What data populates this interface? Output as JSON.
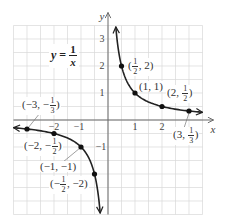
{
  "chart_data": {
    "type": "line",
    "xlabel": "x",
    "ylabel": "y",
    "xlim": [
      -3.5,
      3.5
    ],
    "ylim": [
      -3.5,
      3.5
    ],
    "grid": true,
    "grid_step": 0.5,
    "legend": null,
    "x_ticks": [
      -2,
      -1,
      1,
      2
    ],
    "y_ticks": [
      -1,
      1,
      2,
      3
    ],
    "series": [
      {
        "name": "y = 1/x",
        "function": "1/x",
        "branches": [
          {
            "x_from": 0.29,
            "x_to": 3.5
          },
          {
            "x_from": -3.5,
            "x_to": -0.29
          }
        ],
        "points": [
          {
            "x": 0.5,
            "y": 2
          },
          {
            "x": 1,
            "y": 1
          },
          {
            "x": 2,
            "y": 0.5
          },
          {
            "x": 3,
            "y": 0.3333
          },
          {
            "x": -3,
            "y": -0.3333
          },
          {
            "x": -2,
            "y": -0.5
          },
          {
            "x": -1,
            "y": -1
          },
          {
            "x": -0.5,
            "y": -2
          }
        ]
      }
    ],
    "annotations": [
      "(1/2, 2)",
      "(1, 1)",
      "(2, 1/2)",
      "(3, 1/3)",
      "(−3, −1/3)",
      "(−2, −1/2)",
      "(−1, −1)",
      "(−1/2, −2)"
    ]
  },
  "equation": {
    "lhs": "y",
    "eq": " = ",
    "num": "1",
    "den": "x"
  },
  "axes": {
    "x_label": "x",
    "y_label": "y",
    "x_tick_labels": [
      "−2",
      "−1",
      "1",
      "2"
    ],
    "y_tick_labels": [
      "3",
      "2",
      "1",
      "−1"
    ]
  },
  "point_labels": [
    {
      "pre": "(",
      "num": "1",
      "den": "2",
      "post": ", 2)"
    },
    {
      "pre": "(1, 1)",
      "num": "",
      "den": "",
      "post": ""
    },
    {
      "pre": "(2, ",
      "num": "1",
      "den": "2",
      "post": ")"
    },
    {
      "pre": "(3, ",
      "num": "1",
      "den": "3",
      "post": ")"
    },
    {
      "pre": "(−3, −",
      "num": "1",
      "den": "3",
      "post": ")"
    },
    {
      "pre": "(−2, −",
      "num": "1",
      "den": "2",
      "post": ")"
    },
    {
      "pre": "(−1, −1)",
      "num": "",
      "den": "",
      "post": ""
    },
    {
      "pre": "(−",
      "num": "1",
      "den": "2",
      "post": ", −2)"
    }
  ],
  "colors": {
    "grid": "#d9d9d9",
    "axis": "#6a6a6a",
    "curve": "#222222",
    "point": "#111111",
    "leader": "#777777"
  }
}
